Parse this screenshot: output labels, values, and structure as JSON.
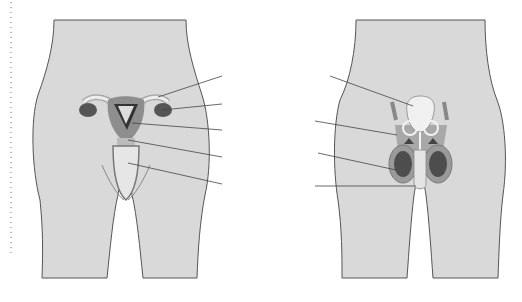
{
  "figure": {
    "panel_a": {
      "caption": "(a)",
      "labels": [
        "oviduct",
        "ovary",
        "uterus",
        "cervix",
        "vagina"
      ]
    },
    "panel_b": {
      "caption": "(b)",
      "labels": [
        "bladder",
        "sperm",
        "duct",
        "testis",
        "penis"
      ]
    },
    "colors": {
      "body": "#d9d9d9",
      "outline": "#555555",
      "organ": "#9a9a9a",
      "dark": "#4a4a4a",
      "light": "#eeeeee"
    }
  }
}
